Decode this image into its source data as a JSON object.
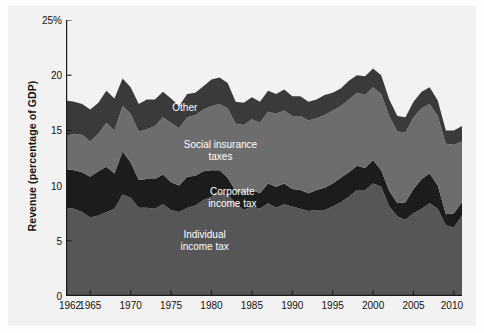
{
  "chart_data": {
    "type": "area",
    "stacked": true,
    "title": "",
    "subtitle": "",
    "xlabel": "",
    "ylabel": "Revenue (percentage of GDP)",
    "xlim": [
      1962,
      2011
    ],
    "ylim": [
      0,
      25
    ],
    "grid": false,
    "legend_position": "inline-annotations",
    "y_ticks": [
      0,
      5,
      10,
      15,
      20,
      25
    ],
    "y_tick_labels": [
      "0",
      "5",
      "10",
      "15",
      "20",
      "25%"
    ],
    "x_ticks": [
      1962,
      1965,
      1970,
      1975,
      1980,
      1985,
      1990,
      1995,
      2000,
      2005,
      2010
    ],
    "x_tick_labels": [
      "1962",
      "1965",
      "1970",
      "1975",
      "1980",
      "1985",
      "1990",
      "1995",
      "2000",
      "2005",
      "2010"
    ],
    "x": [
      1962,
      1963,
      1964,
      1965,
      1966,
      1967,
      1968,
      1969,
      1970,
      1971,
      1972,
      1973,
      1974,
      1975,
      1976,
      1977,
      1978,
      1979,
      1980,
      1981,
      1982,
      1983,
      1984,
      1985,
      1986,
      1987,
      1988,
      1989,
      1990,
      1991,
      1992,
      1993,
      1994,
      1995,
      1996,
      1997,
      1998,
      1999,
      2000,
      2001,
      2002,
      2003,
      2004,
      2005,
      2006,
      2007,
      2008,
      2009,
      2010,
      2011
    ],
    "series": [
      {
        "name": "Individual income tax",
        "color": "#565656",
        "values": [
          8.0,
          7.9,
          7.6,
          7.1,
          7.3,
          7.6,
          7.9,
          9.2,
          8.9,
          8.0,
          8.0,
          7.9,
          8.3,
          7.8,
          7.6,
          8.0,
          8.2,
          8.7,
          9.0,
          9.4,
          9.2,
          8.4,
          7.8,
          8.1,
          7.9,
          8.4,
          8.0,
          8.3,
          8.1,
          7.9,
          7.7,
          7.8,
          7.8,
          8.1,
          8.5,
          9.0,
          9.6,
          9.6,
          10.2,
          9.9,
          8.1,
          7.2,
          6.9,
          7.5,
          7.9,
          8.4,
          7.9,
          6.4,
          6.2,
          7.3
        ]
      },
      {
        "name": "Corporate income tax",
        "color": "#1c1c1c",
        "values": [
          3.5,
          3.5,
          3.6,
          3.7,
          4.0,
          4.1,
          3.2,
          3.9,
          3.2,
          2.5,
          2.6,
          2.7,
          2.7,
          2.5,
          2.4,
          2.8,
          2.7,
          2.6,
          2.4,
          2.0,
          1.5,
          1.1,
          1.5,
          1.5,
          1.4,
          1.8,
          1.9,
          1.9,
          1.6,
          1.7,
          1.6,
          1.8,
          2.0,
          2.1,
          2.2,
          2.2,
          2.2,
          2.0,
          2.1,
          1.5,
          1.4,
          1.2,
          1.6,
          2.2,
          2.7,
          2.7,
          2.1,
          1.0,
          1.3,
          1.2
        ]
      },
      {
        "name": "Social insurance taxes",
        "color": "#6d6d6d",
        "values": [
          3.0,
          3.3,
          3.4,
          3.2,
          3.4,
          4.0,
          3.9,
          4.1,
          4.4,
          4.4,
          4.5,
          4.8,
          5.2,
          5.4,
          5.2,
          5.4,
          5.5,
          5.6,
          5.8,
          6.0,
          6.3,
          6.1,
          6.2,
          6.4,
          6.4,
          6.5,
          6.6,
          6.6,
          6.6,
          6.7,
          6.6,
          6.5,
          6.6,
          6.6,
          6.5,
          6.6,
          6.6,
          6.6,
          6.6,
          6.9,
          6.8,
          6.5,
          6.3,
          6.5,
          6.4,
          6.3,
          6.3,
          6.4,
          6.2,
          5.5
        ]
      },
      {
        "name": "Other",
        "color": "#3a3a3a",
        "values": [
          3.2,
          2.9,
          2.8,
          2.9,
          2.8,
          2.9,
          2.9,
          2.5,
          2.4,
          2.5,
          2.7,
          2.4,
          2.3,
          2.2,
          2.0,
          2.1,
          2.0,
          2.1,
          2.4,
          2.4,
          2.3,
          2.0,
          2.0,
          2.0,
          1.9,
          1.9,
          1.8,
          1.9,
          1.8,
          1.8,
          1.7,
          1.7,
          1.8,
          1.6,
          1.6,
          1.7,
          1.6,
          1.7,
          1.7,
          1.7,
          1.5,
          1.4,
          1.4,
          1.4,
          1.5,
          1.5,
          1.4,
          1.2,
          1.3,
          1.4
        ]
      }
    ],
    "annotations": [
      {
        "text": "Other",
        "x_frac": 0.3,
        "y_frac": 0.32
      },
      {
        "text": "Social insurance taxes",
        "x_frac": 0.39,
        "y_frac": 0.475
      },
      {
        "text": "Corporate income tax",
        "x_frac": 0.42,
        "y_frac": 0.645
      },
      {
        "text": "Individual income tax",
        "x_frac": 0.35,
        "y_frac": 0.8
      }
    ],
    "colors": {
      "individual_income_tax": "#565656",
      "corporate_income_tax": "#1c1c1c",
      "social_insurance_taxes": "#6d6d6d",
      "other": "#3a3a3a",
      "panel_background": "#f2f2f2",
      "axis": "#1a1a1a",
      "annotation_text": "#ffffff"
    }
  }
}
